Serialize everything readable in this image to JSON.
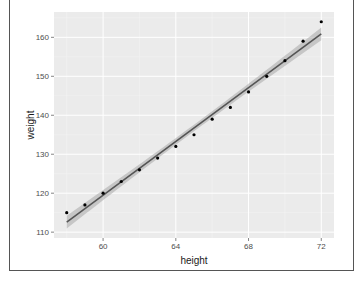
{
  "chart_data": {
    "type": "scatter",
    "title": "",
    "xlabel": "height",
    "ylabel": "weight",
    "xlim": [
      57.3,
      72.7
    ],
    "ylim": [
      108.5,
      166.5
    ],
    "x_ticks": [
      60,
      64,
      68,
      72
    ],
    "y_ticks": [
      110,
      120,
      130,
      140,
      150,
      160
    ],
    "x_tick_labels": [
      "60",
      "64",
      "68",
      "72"
    ],
    "y_tick_labels": [
      "110",
      "120",
      "130",
      "140",
      "150",
      "160"
    ],
    "x_minor": [
      58,
      62,
      66,
      70
    ],
    "y_minor": [
      115,
      125,
      135,
      145,
      155,
      165
    ],
    "grid": true,
    "series": [
      {
        "name": "points",
        "x": [
          58,
          59,
          60,
          61,
          62,
          63,
          64,
          65,
          66,
          67,
          68,
          69,
          70,
          71,
          72
        ],
        "y": [
          115,
          117,
          120,
          123,
          126,
          129,
          132,
          135,
          139,
          142,
          146,
          150,
          154,
          159,
          164
        ]
      }
    ],
    "fit": {
      "method": "lm",
      "intercept": -87.51667,
      "slope": 3.45,
      "se_band": true
    },
    "colors": {
      "panel": "#ebebeb",
      "grid_major": "#ffffff",
      "point": "#000000",
      "line": "#555555",
      "band": "#a8a8a8"
    }
  }
}
